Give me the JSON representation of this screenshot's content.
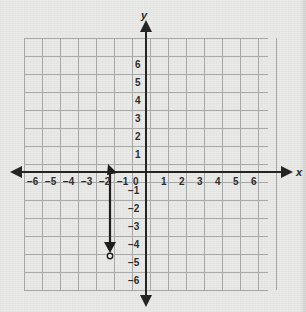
{
  "figure": {
    "kind": "coordinate-plane-graph",
    "width": 306,
    "height": 312,
    "background_color": "#e9e9e7",
    "grid_color": "#a9a9a7",
    "axis_color": "#212121",
    "curve_color": "#1a1a1a"
  },
  "axes": {
    "x_axis_name": "x",
    "y_axis_name": "y",
    "origin_label": "0",
    "x_tick_labels": [
      "-6",
      "-5",
      "-4",
      "-3",
      "-2",
      "-1",
      "1",
      "2",
      "3",
      "4",
      "5",
      "6"
    ],
    "y_tick_labels": [
      "6",
      "5",
      "4",
      "3",
      "2",
      "1",
      "-1",
      "-2",
      "-3",
      "-4",
      "-5",
      "-6"
    ],
    "xlim": [
      -7,
      7
    ],
    "ylim": [
      -7,
      7
    ],
    "grid": true,
    "arrowheads": [
      "left",
      "right",
      "up",
      "down"
    ]
  },
  "chart_data": {
    "type": "line",
    "title": "",
    "xlabel": "x",
    "ylabel": "y",
    "xlim": [
      -7,
      7
    ],
    "ylim": [
      -7,
      7
    ],
    "grid": true,
    "legend": "none",
    "x_ticks": [
      -6,
      -5,
      -4,
      -3,
      -2,
      -1,
      0,
      1,
      2,
      3,
      4,
      5,
      6
    ],
    "y_ticks": [
      -6,
      -5,
      -4,
      -3,
      -2,
      -1,
      0,
      1,
      2,
      3,
      4,
      5,
      6
    ],
    "x_tick_labels": [
      "-6",
      "-5",
      "-4",
      "-3",
      "-2",
      "-1",
      "0",
      "1",
      "2",
      "3",
      "4",
      "5",
      "6"
    ],
    "y_tick_labels": [
      "-6",
      "-5",
      "-4",
      "-3",
      "-2",
      "-1",
      "0",
      "1",
      "2",
      "3",
      "4",
      "5",
      "6"
    ],
    "series": [
      {
        "name": "vertical-ray",
        "type": "segment",
        "x": [
          -2,
          -2
        ],
        "y": [
          0,
          -4.5
        ],
        "start_point": {
          "x": -2,
          "y": 0,
          "marker": "arrowhead-up"
        },
        "end_point": {
          "x": -2,
          "y": -4.5,
          "marker": "open-circle-with-arrowhead-down"
        },
        "color": "#1a1a1a",
        "line_width": 2
      }
    ],
    "annotations": []
  },
  "grid_geometry": {
    "origin_px": {
      "x": 146,
      "y": 172
    },
    "cell_px": 18,
    "left_px": 24,
    "right_px": 268,
    "top_px": 38,
    "bottom_px": 290
  }
}
